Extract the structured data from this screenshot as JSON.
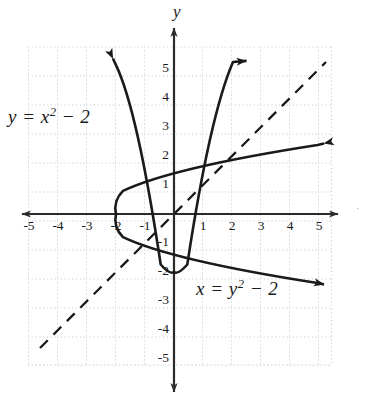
{
  "figure": {
    "background_color": "#ffffff",
    "curve_color": "#1a1a1a",
    "axis_color": "#2b2b2b",
    "grid_color": "#c9c9d6"
  },
  "axes": {
    "y_axis_name": "y",
    "x_axis_name": "",
    "origin_px": [
      174,
      214
    ],
    "unit_px": 29,
    "xlim": [
      -5.2,
      5.6
    ],
    "ylim": [
      -5.8,
      6.2
    ],
    "grid": "dotted",
    "x_ticks": [
      "-5",
      "-4",
      "-3",
      "-2",
      "-1",
      "1",
      "2",
      "3",
      "4",
      "5"
    ],
    "y_ticks": [
      "5",
      "4",
      "3",
      "2",
      "1",
      "-1",
      "-2",
      "-3",
      "-4",
      "-5"
    ]
  },
  "labels": {
    "parabola_vertical": {
      "lhs": "y",
      "eq": "=",
      "base": "x",
      "exponent": "2",
      "rest": "− 2",
      "full": "y = x² − 2"
    },
    "parabola_horizontal": {
      "lhs": "x",
      "eq": "=",
      "base": "y",
      "exponent": "2",
      "rest": "− 2",
      "full": "x = y² − 2"
    }
  },
  "chart_data": {
    "type": "line",
    "title": "",
    "xlabel": "",
    "ylabel": "y",
    "xlim": [
      -5.2,
      5.6
    ],
    "ylim": [
      -5.8,
      6.2
    ],
    "grid": true,
    "legend": "none",
    "x_tick_values": [
      -5,
      -4,
      -3,
      -2,
      -1,
      1,
      2,
      3,
      4,
      5
    ],
    "y_tick_values": [
      5,
      4,
      3,
      2,
      1,
      -1,
      -2,
      -3,
      -4,
      -5
    ],
    "series": [
      {
        "name": "y = x^2 - 2",
        "type": "parabola-vertical",
        "equation": "y = x^2 - 2",
        "vertex": [
          0,
          -2
        ],
        "opens": "up",
        "domain": [
          -2.15,
          2.6
        ],
        "arrow_start": true,
        "arrow_end": true,
        "style": "solid",
        "points": [
          [
            -2.15,
            2.62
          ],
          [
            -2.0,
            2.0
          ],
          [
            -1.75,
            1.06
          ],
          [
            -1.5,
            0.25
          ],
          [
            -1.41,
            0.0
          ],
          [
            -1.25,
            -0.44
          ],
          [
            -1.0,
            -1.0
          ],
          [
            -0.75,
            -1.44
          ],
          [
            -0.5,
            -1.75
          ],
          [
            -0.25,
            -1.94
          ],
          [
            0,
            -2.0
          ],
          [
            0.25,
            -1.94
          ],
          [
            0.5,
            -1.75
          ],
          [
            0.75,
            -1.44
          ],
          [
            1.0,
            -1.0
          ],
          [
            1.25,
            -0.44
          ],
          [
            1.41,
            0.0
          ],
          [
            1.5,
            0.25
          ],
          [
            1.75,
            1.06
          ],
          [
            2.0,
            2.0
          ],
          [
            2.25,
            3.06
          ],
          [
            2.5,
            4.25
          ],
          [
            2.6,
            4.76
          ]
        ]
      },
      {
        "name": "x = y^2 - 2",
        "type": "parabola-horizontal",
        "equation": "x = y^2 - 2",
        "vertex": [
          -2,
          0
        ],
        "opens": "right",
        "range": [
          -2.42,
          2.42
        ],
        "arrow_start": true,
        "arrow_end": true,
        "style": "solid",
        "points": [
          [
            3.86,
            2.42
          ],
          [
            2.0,
            2.0
          ],
          [
            1.06,
            1.75
          ],
          [
            0.25,
            1.5
          ],
          [
            0.0,
            1.41
          ],
          [
            -0.44,
            1.25
          ],
          [
            -1.0,
            1.0
          ],
          [
            -1.44,
            0.75
          ],
          [
            -1.75,
            0.5
          ],
          [
            -1.94,
            0.25
          ],
          [
            -2.0,
            0
          ],
          [
            -1.94,
            -0.25
          ],
          [
            -1.75,
            -0.5
          ],
          [
            -1.44,
            -0.75
          ],
          [
            -1.0,
            -1.0
          ],
          [
            -0.44,
            -1.25
          ],
          [
            0.0,
            -1.41
          ],
          [
            0.25,
            -1.5
          ],
          [
            1.06,
            -1.75
          ],
          [
            2.0,
            -2.0
          ],
          [
            3.06,
            -2.25
          ],
          [
            3.86,
            -2.42
          ]
        ]
      },
      {
        "name": "y = x",
        "type": "line",
        "equation": "y = x",
        "slope": 1,
        "intercept": 0,
        "style": "dashed",
        "arrow_start": false,
        "arrow_end": false,
        "points": [
          [
            -4.6,
            -4.6
          ],
          [
            5.2,
            5.2
          ]
        ]
      }
    ],
    "intersections": [
      [
        -1,
        -1
      ],
      [
        2,
        2
      ]
    ],
    "annotations": [
      {
        "text": "y = x² − 2",
        "x": -4.7,
        "y": 3.2
      },
      {
        "text": "x = y² − 2",
        "x": 1.0,
        "y": -2.8
      }
    ]
  }
}
